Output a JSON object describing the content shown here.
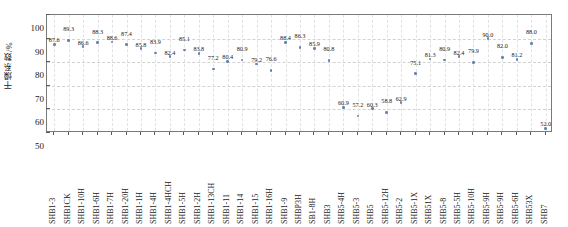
{
  "chart_data": {
    "type": "scatter",
    "title": "",
    "subtitle": "",
    "xlabel": "",
    "ylabel": "干燥系数/%",
    "ylim": [
      50,
      100
    ],
    "yticks": [
      50,
      60,
      70,
      80,
      90,
      100
    ],
    "grid": true,
    "legend": null,
    "marker_color": "#4a6fa5",
    "axis_color": "#7a7a7a",
    "categories": [
      "SHB1-3",
      "SHB1CK",
      "SHB1-10H",
      "SHB1-6H",
      "SHB1-7H",
      "SHB1-20H",
      "SHB1-1H",
      "SHB1-4H",
      "SHB1-4HCH",
      "SHB1-5H",
      "SHB1-2H",
      "SHB1-13CH",
      "SHB1-11",
      "SHB1-14",
      "SHB1-15",
      "SHB1-16H",
      "SHB1-9",
      "SHBP3H",
      "SB1-8H",
      "SHB3",
      "SHB5-4H",
      "SHB5-3",
      "SHB5",
      "SHB5-12H",
      "SHB5-2",
      "SHB5-1X",
      "SHB51X",
      "SHB5-8",
      "SHB5-5H",
      "SHB5-10H",
      "SHB5-9H",
      "SHB5-9H",
      "SHB5-6H",
      "SHB53X",
      "SHB7"
    ],
    "values": [
      87.6,
      89.3,
      86.6,
      88.3,
      88.6,
      87.4,
      85.8,
      83.9,
      82.4,
      85.1,
      83.8,
      77.2,
      80.4,
      80.9,
      79.2,
      76.6,
      88.4,
      86.3,
      85.9,
      80.8,
      60.9,
      57.2,
      60.3,
      58.8,
      62.9,
      75.1,
      81.3,
      80.9,
      82.4,
      79.9,
      90.0,
      82.0,
      81.2,
      88.0,
      52.0
    ],
    "value_labels": [
      "87.6",
      "89.3",
      "86.6",
      "88.3",
      "88.6",
      "87.4",
      "85.8",
      "83.9",
      "82.4",
      "85.1",
      "83.8",
      "77.2",
      "80.4",
      "80.9",
      "79.2",
      "76.6",
      "88.4",
      "86.3",
      "85.9",
      "80.8",
      "60.9",
      "57.2",
      "60.3",
      "58.8",
      "62.9",
      "75.1",
      "81.3",
      "80.9",
      "82.4",
      "79.9",
      "90.0",
      "82.0",
      "81.2",
      "88.0",
      "52.0"
    ]
  }
}
